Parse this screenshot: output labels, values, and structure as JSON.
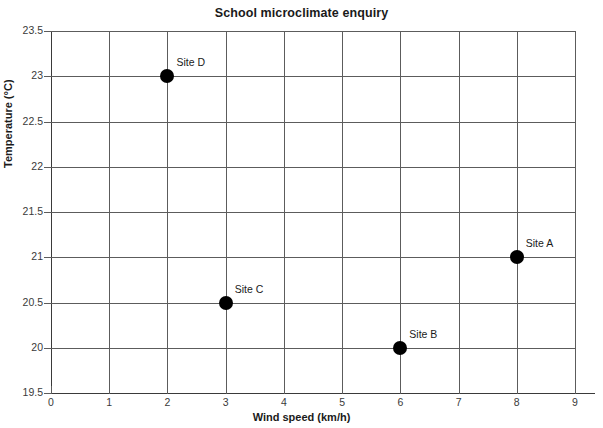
{
  "chart_data": {
    "type": "scatter",
    "title": "School microclimate enquiry",
    "xlabel": "Wind speed (km/h)",
    "ylabel": "Temperature (°C)",
    "xlim": [
      0,
      9
    ],
    "ylim": [
      19.5,
      23.5
    ],
    "xticks": [
      "0",
      "1",
      "2",
      "3",
      "4",
      "5",
      "6",
      "7",
      "8",
      "9"
    ],
    "yticks": [
      "19.5",
      "20",
      "20.5",
      "21",
      "21.5",
      "22",
      "22.5",
      "23",
      "23.5"
    ],
    "grid": true,
    "legend": "none",
    "marker_color": "#000000",
    "grid_color": "#5c5c5c",
    "points": [
      {
        "label": "Site A",
        "x": 8,
        "y": 21
      },
      {
        "label": "Site B",
        "x": 6,
        "y": 20
      },
      {
        "label": "Site C",
        "x": 3,
        "y": 20.5
      },
      {
        "label": "Site D",
        "x": 2,
        "y": 23
      }
    ]
  }
}
